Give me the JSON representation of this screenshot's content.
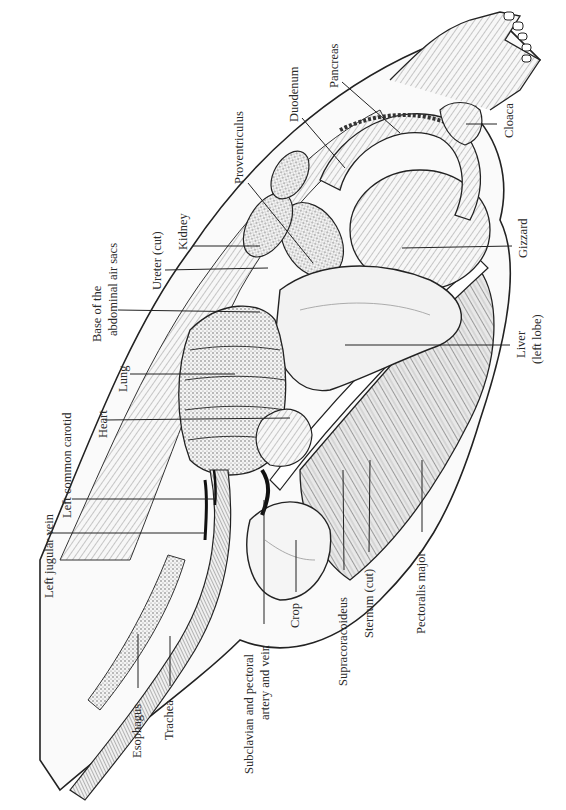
{
  "figure": {
    "orientation": "rotated 90 degrees counter-clockwise",
    "labels": [
      {
        "id": "left-jugular-vein",
        "text": "Left jugular vein",
        "x": 42,
        "y": 598
      },
      {
        "id": "left-common-carotid",
        "text": "Left common carotid",
        "x": 60,
        "y": 518
      },
      {
        "id": "heart",
        "text": "Heart",
        "x": 110,
        "y": 438
      },
      {
        "id": "lung",
        "text": "Lung",
        "x": 128,
        "y": 390
      },
      {
        "id": "base-abdominal-air-sacs-line1",
        "text": "Base of the",
        "x": 90,
        "y": 340
      },
      {
        "id": "base-abdominal-air-sacs-line2",
        "text": "abdominal air sacs",
        "x": 106,
        "y": 338
      },
      {
        "id": "ureter-cut",
        "text": "Ureter (cut)",
        "x": 150,
        "y": 288
      },
      {
        "id": "kidney",
        "text": "Kidney",
        "x": 176,
        "y": 248
      },
      {
        "id": "proventriculus",
        "text": "Proventriculus",
        "x": 232,
        "y": 185
      },
      {
        "id": "duodenum",
        "text": "Duodenum",
        "x": 287,
        "y": 122
      },
      {
        "id": "pancreas",
        "text": "Pancreas",
        "x": 327,
        "y": 88
      },
      {
        "id": "cloaca",
        "text": "Cloaca",
        "x": 502,
        "y": 136
      },
      {
        "id": "gizzard",
        "text": "Gizzard",
        "x": 516,
        "y": 258
      },
      {
        "id": "liver-line1",
        "text": "Liver",
        "x": 514,
        "y": 358
      },
      {
        "id": "liver-line2",
        "text": "(left lobe)",
        "x": 530,
        "y": 362
      },
      {
        "id": "pectoralis-major",
        "text": "Pectoralis major",
        "x": 414,
        "y": 632
      },
      {
        "id": "sternum-cut",
        "text": "Sternum (cut)",
        "x": 364,
        "y": 638
      },
      {
        "id": "supracoracoideus",
        "text": "Supracoracoideus",
        "x": 334,
        "y": 686
      },
      {
        "id": "crop",
        "text": "Crop",
        "x": 288,
        "y": 628
      },
      {
        "id": "subclavian-line1",
        "text": "Subclavian and pectoral",
        "x": 240,
        "y": 774
      },
      {
        "id": "subclavian-line2",
        "text": "artery and vein",
        "x": 258,
        "y": 720
      },
      {
        "id": "trachea",
        "text": "Trachea",
        "x": 162,
        "y": 740
      },
      {
        "id": "esophagus",
        "text": "Esophagus",
        "x": 130,
        "y": 758
      }
    ],
    "leader_lines": [
      {
        "for": "left-jugular-vein",
        "x1": 48,
        "y1": 533,
        "x2": 205,
        "y2": 533
      },
      {
        "for": "left-common-carotid",
        "x1": 72,
        "y1": 499,
        "x2": 215,
        "y2": 499
      },
      {
        "for": "heart",
        "x1": 105,
        "y1": 420,
        "x2": 290,
        "y2": 418
      },
      {
        "for": "lung",
        "x1": 130,
        "y1": 374,
        "x2": 235,
        "y2": 374
      },
      {
        "for": "base-abdominal-air-sacs",
        "x1": 118,
        "y1": 310,
        "x2": 260,
        "y2": 312
      },
      {
        "for": "ureter-cut",
        "x1": 165,
        "y1": 270,
        "x2": 268,
        "y2": 268
      },
      {
        "for": "kidney",
        "x1": 193,
        "y1": 246,
        "x2": 260,
        "y2": 246
      },
      {
        "for": "proventriculus",
        "x1": 248,
        "y1": 183,
        "x2": 313,
        "y2": 263
      },
      {
        "for": "duodenum",
        "x1": 302,
        "y1": 118,
        "x2": 345,
        "y2": 168
      },
      {
        "for": "pancreas",
        "x1": 342,
        "y1": 82,
        "x2": 400,
        "y2": 133
      },
      {
        "for": "cloaca",
        "x1": 466,
        "y1": 124,
        "x2": 497,
        "y2": 124
      },
      {
        "for": "gizzard",
        "x1": 402,
        "y1": 248,
        "x2": 512,
        "y2": 246
      },
      {
        "for": "liver",
        "x1": 345,
        "y1": 345,
        "x2": 510,
        "y2": 345
      },
      {
        "for": "pectoralis-major",
        "x1": 422,
        "y1": 460,
        "x2": 422,
        "y2": 532
      },
      {
        "for": "sternum-cut",
        "x1": 370,
        "y1": 460,
        "x2": 369,
        "y2": 552
      },
      {
        "for": "supracoracoideus",
        "x1": 343,
        "y1": 470,
        "x2": 344,
        "y2": 570
      },
      {
        "for": "crop",
        "x1": 296,
        "y1": 540,
        "x2": 296,
        "y2": 592
      },
      {
        "for": "subclavian",
        "x1": 264,
        "y1": 500,
        "x2": 264,
        "y2": 624
      },
      {
        "for": "trachea",
        "x1": 170,
        "y1": 636,
        "x2": 170,
        "y2": 686
      },
      {
        "for": "esophagus",
        "x1": 138,
        "y1": 634,
        "x2": 138,
        "y2": 688
      }
    ]
  }
}
